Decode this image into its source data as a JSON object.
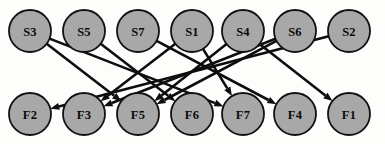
{
  "diagram": {
    "width": 385,
    "height": 144,
    "background_color": "#fdfdfc",
    "node": {
      "fill_color": "#a8a8a8",
      "stroke_color": "#111111",
      "stroke_width": 1.8,
      "radius": 21,
      "label_color": "#0a0a0a"
    },
    "edge": {
      "stroke_color": "#0d0d0d",
      "stroke_width": 2.6,
      "arrowhead": "filled-triangle",
      "arrow_length": 9,
      "arrow_width": 7
    },
    "source_row": {
      "name": "source-nodes",
      "y": 31,
      "nodes": [
        {
          "id": "S3",
          "label": "S3",
          "x": 30
        },
        {
          "id": "S5",
          "label": "S5",
          "x": 84
        },
        {
          "id": "S7",
          "label": "S7",
          "x": 138
        },
        {
          "id": "S1",
          "label": "S1",
          "x": 192
        },
        {
          "id": "S4",
          "label": "S4",
          "x": 243
        },
        {
          "id": "S6",
          "label": "S6",
          "x": 295
        },
        {
          "id": "S2",
          "label": "S2",
          "x": 349
        }
      ]
    },
    "sink_row": {
      "name": "sink-nodes",
      "y": 114,
      "nodes": [
        {
          "id": "F2",
          "label": "F2",
          "x": 30
        },
        {
          "id": "F3",
          "label": "F3",
          "x": 84
        },
        {
          "id": "F5",
          "label": "F5",
          "x": 138
        },
        {
          "id": "F6",
          "label": "F6",
          "x": 192
        },
        {
          "id": "F7",
          "label": "F7",
          "x": 243
        },
        {
          "id": "F4",
          "label": "F4",
          "x": 295
        },
        {
          "id": "F1",
          "label": "F1",
          "x": 349
        }
      ]
    },
    "edges": [
      {
        "from": "S3",
        "to": "F5"
      },
      {
        "from": "S3",
        "to": "F7"
      },
      {
        "from": "S5",
        "to": "F6"
      },
      {
        "from": "S7",
        "to": "F4"
      },
      {
        "from": "S1",
        "to": "F3"
      },
      {
        "from": "S1",
        "to": "F7"
      },
      {
        "from": "S4",
        "to": "F5"
      },
      {
        "from": "S4",
        "to": "F1"
      },
      {
        "from": "S6",
        "to": "F3"
      },
      {
        "from": "S6",
        "to": "F5"
      },
      {
        "from": "S2",
        "to": "F2"
      }
    ]
  }
}
